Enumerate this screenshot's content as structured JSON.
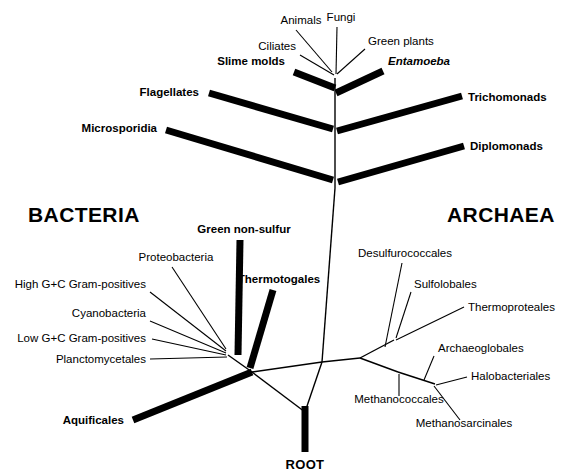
{
  "figure": {
    "background_color": "#ffffff",
    "line_color": "#000000",
    "width": 574,
    "height": 475
  },
  "domains": [
    {
      "name": "bacteria",
      "label": "BACTERIA",
      "x": 28,
      "y": 222
    },
    {
      "name": "archaea",
      "label": "ARCHAEA",
      "x": 447,
      "y": 222
    }
  ],
  "root": {
    "label": "ROOT",
    "x": 305,
    "y": 469
  },
  "eukaryote_crown": {
    "vertex": {
      "x": 335,
      "y": 78
    },
    "taxa": [
      {
        "name": "animals",
        "label": "Animals",
        "style": "plain",
        "anchor": "middle",
        "tx": 301,
        "ty": 24,
        "lx": 296,
        "ly": 30,
        "ex": 332,
        "ey": 72
      },
      {
        "name": "fungi",
        "label": "Fungi",
        "style": "plain",
        "anchor": "middle",
        "tx": 341,
        "ty": 21,
        "lx": 337,
        "ly": 27,
        "ex": 336,
        "ey": 74
      },
      {
        "name": "ciliates",
        "label": "Ciliates",
        "style": "plain",
        "anchor": "end",
        "tx": 296,
        "ty": 50,
        "lx": 300,
        "ly": 55,
        "ex": 334,
        "ey": 75
      },
      {
        "name": "green-plants",
        "label": "Green plants",
        "style": "plain",
        "anchor": "start",
        "tx": 368,
        "ty": 45,
        "lx": 365,
        "ly": 49,
        "ex": 337,
        "ey": 74
      }
    ]
  },
  "thick_branches": [
    {
      "name": "slime-molds",
      "label": "Slime molds",
      "style": "bold",
      "anchor": "end",
      "tx": 285,
      "ty": 65,
      "x1": 294,
      "y1": 72,
      "x2": 335,
      "y2": 88
    },
    {
      "name": "entamoeba",
      "label": "Entamoeba",
      "style": "bold-italic",
      "anchor": "start",
      "tx": 388,
      "ty": 65,
      "x1": 383,
      "y1": 71,
      "x2": 336,
      "y2": 93
    },
    {
      "name": "flagellates",
      "label": "Flagellates",
      "style": "bold",
      "anchor": "end",
      "tx": 199,
      "ty": 96,
      "x1": 209,
      "y1": 93,
      "x2": 333,
      "y2": 129
    },
    {
      "name": "trichomonads",
      "label": "Trichomonads",
      "style": "bold",
      "anchor": "start",
      "tx": 468,
      "ty": 101,
      "x1": 462,
      "y1": 96,
      "x2": 337,
      "y2": 131
    },
    {
      "name": "microsporidia",
      "label": "Microsporidia",
      "style": "bold",
      "anchor": "end",
      "tx": 157,
      "ty": 132,
      "x1": 166,
      "y1": 130,
      "x2": 333,
      "y2": 180
    },
    {
      "name": "diplomonads",
      "label": "Diplomonads",
      "style": "bold",
      "anchor": "start",
      "tx": 470,
      "ty": 150,
      "x1": 464,
      "y1": 146,
      "x2": 338,
      "y2": 182
    },
    {
      "name": "green-non-sulfur",
      "label": "Green non-sulfur",
      "style": "bold",
      "anchor": "middle",
      "tx": 244,
      "ty": 233,
      "x1": 240,
      "y1": 240,
      "x2": 238,
      "y2": 355
    },
    {
      "name": "thermotogales",
      "label": "Thermotogales",
      "style": "bold",
      "anchor": "middle",
      "tx": 279,
      "ty": 283,
      "x1": 273,
      "y1": 290,
      "x2": 250,
      "y2": 368
    },
    {
      "name": "aquificales",
      "label": "Aquificales",
      "style": "bold",
      "anchor": "end",
      "tx": 124,
      "ty": 424,
      "x1": 133,
      "y1": 420,
      "x2": 252,
      "y2": 372
    }
  ],
  "trunk": {
    "name": "central-trunk",
    "segments": [
      {
        "name": "eukaryote-stem",
        "x1": 335,
        "y1": 78,
        "x2": 335,
        "y2": 188
      },
      {
        "name": "universal-stem",
        "x1": 335,
        "y1": 188,
        "x2": 322,
        "y2": 362
      },
      {
        "name": "bacteria-link",
        "x1": 322,
        "y1": 362,
        "x2": 252,
        "y2": 372
      },
      {
        "name": "archaea-link",
        "x1": 322,
        "y1": 362,
        "x2": 360,
        "y2": 358
      },
      {
        "name": "root-link",
        "x1": 252,
        "y1": 372,
        "x2": 305,
        "y2": 412
      },
      {
        "name": "archaea-root-link",
        "x1": 322,
        "y1": 362,
        "x2": 305,
        "y2": 412
      }
    ]
  },
  "root_stub": {
    "name": "root-stem",
    "x1": 305,
    "y1": 406,
    "x2": 305,
    "y2": 452
  },
  "bacteria_fan": {
    "node": {
      "x": 228,
      "y": 355
    },
    "stem": {
      "x1": 228,
      "y1": 355,
      "x2": 252,
      "y2": 372
    },
    "taxa": [
      {
        "name": "proteobacteria",
        "label": "Proteobacteria",
        "anchor": "middle",
        "tx": 176,
        "ty": 261,
        "lx": 172,
        "ly": 267,
        "ex": 226,
        "ey": 349
      },
      {
        "name": "high-gc-gram-positives",
        "label": "High G+C Gram-positives",
        "anchor": "end",
        "tx": 146,
        "ty": 288,
        "lx": 150,
        "ly": 292,
        "ex": 226,
        "ey": 351
      },
      {
        "name": "cyanobacteria",
        "label": "Cyanobacteria",
        "anchor": "end",
        "tx": 146,
        "ty": 317,
        "lx": 150,
        "ly": 321,
        "ex": 226,
        "ey": 353
      },
      {
        "name": "low-gc-gram-positives",
        "label": "Low G+C Gram-positives",
        "anchor": "end",
        "tx": 146,
        "ty": 342,
        "lx": 152,
        "ly": 339,
        "ex": 226,
        "ey": 355
      },
      {
        "name": "planctomycetales",
        "label": "Planctomycetales",
        "anchor": "end",
        "tx": 146,
        "ty": 363,
        "lx": 150,
        "ly": 359,
        "ex": 227,
        "ey": 357
      }
    ]
  },
  "archaea_tree": {
    "root_node": {
      "x": 360,
      "y": 358
    },
    "crenarchaeota_node": {
      "x": 394,
      "y": 340
    },
    "crenarchaeota_split": {
      "x": 394,
      "y": 340
    },
    "euryarchaeota_node": {
      "x": 398,
      "y": 372
    },
    "euryarchaeota_split": {
      "x": 435,
      "y": 384
    },
    "internal": [
      {
        "name": "archaea-base-to-cren",
        "x1": 360,
        "y1": 358,
        "x2": 394,
        "y2": 340
      },
      {
        "name": "archaea-base-to-eury",
        "x1": 360,
        "y1": 358,
        "x2": 398,
        "y2": 372
      },
      {
        "name": "eury-to-split",
        "x1": 398,
        "y1": 372,
        "x2": 435,
        "y2": 384
      }
    ],
    "taxa": [
      {
        "name": "desulfurococcales",
        "label": "Desulfurococcales",
        "anchor": "middle",
        "tx": 405,
        "ty": 257,
        "lx": 402,
        "ly": 263,
        "ex": 385,
        "ey": 347
      },
      {
        "name": "sulfolobales",
        "label": "Sulfolobales",
        "anchor": "start",
        "tx": 414,
        "ty": 288,
        "lx": 411,
        "ly": 292,
        "ex": 396,
        "ey": 338
      },
      {
        "name": "thermoproteales",
        "label": "Thermoproteales",
        "anchor": "start",
        "tx": 468,
        "ty": 311,
        "lx": 464,
        "ly": 307,
        "ex": 396,
        "ey": 340
      },
      {
        "name": "archaeoglobales",
        "label": "Archaeoglobales",
        "anchor": "start",
        "tx": 438,
        "ty": 352,
        "lx": 434,
        "ly": 356,
        "ex": 424,
        "ey": 380
      },
      {
        "name": "halobacteriales",
        "label": "Halobacteriales",
        "anchor": "start",
        "tx": 471,
        "ty": 380,
        "lx": 467,
        "ly": 377,
        "ex": 436,
        "ey": 385
      },
      {
        "name": "methanococcales",
        "label": "Methanococcales",
        "anchor": "middle",
        "tx": 399,
        "ty": 403,
        "lx": 399,
        "ly": 396,
        "ex": 399,
        "ey": 374
      },
      {
        "name": "methanosarcinales",
        "label": "Methanosarcinales",
        "anchor": "middle",
        "tx": 464,
        "ty": 427,
        "lx": 460,
        "ly": 420,
        "ex": 434,
        "ey": 386
      }
    ]
  },
  "chart_data": {
    "type": "tree",
    "domains": [
      "BACTERIA",
      "ARCHAEA",
      "EUKARYA"
    ],
    "root_marker": "ROOT",
    "bacteria_taxa": [
      "Aquificales",
      "Thermotogales",
      "Green non-sulfur",
      "Planctomycetales",
      "Low G+C Gram-positives",
      "Cyanobacteria",
      "High G+C Gram-positives",
      "Proteobacteria"
    ],
    "archaea_taxa": [
      "Desulfurococcales",
      "Sulfolobales",
      "Thermoproteales",
      "Archaeoglobales",
      "Halobacteriales",
      "Methanococcales",
      "Methanosarcinales"
    ],
    "eukarya_taxa": [
      "Diplomonads",
      "Microsporidia",
      "Trichomonads",
      "Flagellates",
      "Entamoeba",
      "Slime molds",
      "Ciliates",
      "Green plants",
      "Animals",
      "Fungi"
    ],
    "emphasis_note": "Bold labels mark deep-branching lineages drawn with thick branch strokes; plain labels mark shallow branches drawn with thin leader lines."
  }
}
